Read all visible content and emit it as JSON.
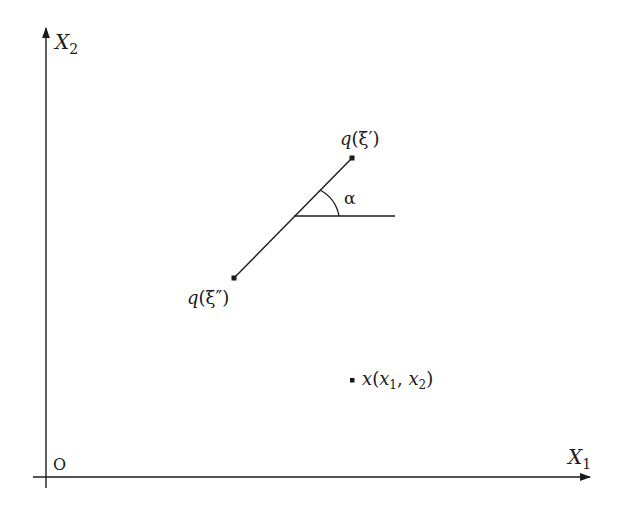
{
  "diagram": {
    "type": "coordinate-geometry",
    "axes": {
      "x_label": "X",
      "x_label_sub": "1",
      "y_label": "X",
      "y_label_sub": "2",
      "origin_label": "O"
    },
    "segment": {
      "start_label_q": "q",
      "start_label_arg": "(ξ″)",
      "end_label_q": "q",
      "end_label_arg": "(ξ′)",
      "angle_label": "α"
    },
    "point": {
      "name": "x",
      "open": "(",
      "x1": "x",
      "x1_sub": "1",
      "comma": ", ",
      "x2": "x",
      "x2_sub": "2",
      "close": ")"
    }
  }
}
